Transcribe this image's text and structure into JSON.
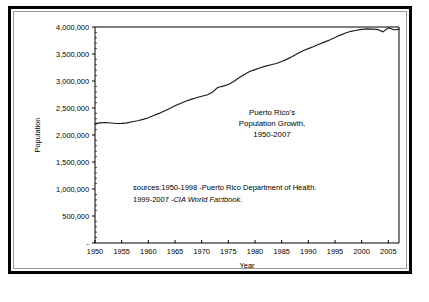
{
  "chart_data": {
    "type": "line",
    "title": "",
    "annotation_title": [
      "Puerto Rico's",
      "Population Growth,",
      "1950-2007"
    ],
    "xlabel": "Year",
    "ylabel": "Population",
    "xlim": [
      1950,
      2007
    ],
    "ylim": [
      0,
      4000000
    ],
    "grid": false,
    "legend": "none",
    "x_ticks": [
      "1950",
      "1955",
      "1960",
      "1965",
      "1970",
      "1975",
      "1980",
      "1985",
      "1990",
      "1995",
      "2000",
      "2005"
    ],
    "x_tick_values": [
      1950,
      1955,
      1960,
      1965,
      1970,
      1975,
      1980,
      1985,
      1990,
      1995,
      2000,
      2005
    ],
    "y_ticks": [
      "-",
      "500,000",
      "1,000,000",
      "1,500,000",
      "2,000,000",
      "2,500,000",
      "3,000,000",
      "3,500,000",
      "4,000,000"
    ],
    "y_tick_values": [
      0,
      500000,
      1000000,
      1500000,
      2000000,
      2500000,
      3000000,
      3500000,
      4000000
    ],
    "sources": [
      "sources:1950-1998  -Puerto Rico Department of Health.",
      "1999-2007 -",
      "CIA World Factbook",
      "."
    ],
    "series": [
      {
        "name": "Puerto Rico Population",
        "x": [
          1950,
          1951,
          1952,
          1953,
          1954,
          1955,
          1956,
          1957,
          1958,
          1959,
          1960,
          1961,
          1962,
          1963,
          1964,
          1965,
          1966,
          1967,
          1968,
          1969,
          1970,
          1971,
          1972,
          1973,
          1974,
          1975,
          1976,
          1977,
          1978,
          1979,
          1980,
          1981,
          1982,
          1983,
          1984,
          1985,
          1986,
          1987,
          1988,
          1989,
          1990,
          1991,
          1992,
          1993,
          1994,
          1995,
          1996,
          1997,
          1998,
          1999,
          2000,
          2001,
          2002,
          2003,
          2004,
          2005,
          2006,
          2007
        ],
        "values": [
          2210000,
          2225000,
          2232000,
          2222000,
          2212000,
          2215000,
          2225000,
          2245000,
          2265000,
          2290000,
          2320000,
          2360000,
          2400000,
          2445000,
          2490000,
          2540000,
          2585000,
          2625000,
          2660000,
          2690000,
          2718000,
          2740000,
          2790000,
          2880000,
          2905000,
          2935000,
          2990000,
          3060000,
          3120000,
          3175000,
          3210000,
          3245000,
          3275000,
          3300000,
          3325000,
          3360000,
          3405000,
          3455000,
          3510000,
          3560000,
          3600000,
          3640000,
          3680000,
          3720000,
          3760000,
          3805000,
          3850000,
          3890000,
          3920000,
          3940000,
          3955000,
          3965000,
          3960000,
          3955000,
          3910000,
          3985000,
          3950000,
          3955000
        ]
      }
    ]
  },
  "axes": {
    "y_axis_label": "Population",
    "x_axis_label": "Year"
  }
}
